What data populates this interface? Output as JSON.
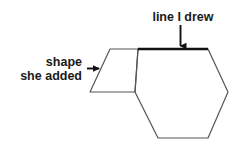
{
  "canvas": {
    "width": 240,
    "height": 143,
    "background": "#ffffff"
  },
  "colors": {
    "shape_stroke": "#555555",
    "thick_line": "#111111",
    "text": "#1a1a1a",
    "arrow": "#111111"
  },
  "annotations": {
    "top_label": {
      "text": "line I drew",
      "arrow": "down-arrow"
    },
    "left_label": {
      "line1": "shape",
      "line2": "she added",
      "arrow": "right-arrow"
    }
  },
  "figure": {
    "parallelogram": {
      "name": "parallelogram-shape-she-added",
      "points": "110,49 138,49 135,92 90,92"
    },
    "hexagon": {
      "name": "hexagon-shape",
      "points": "138,49 208,49 228,92 208,138 158,138 135,92"
    },
    "highlighted_edge": {
      "name": "thick-top-edge-line-i-drew",
      "x1": 138,
      "y1": 49,
      "x2": 208,
      "y2": 49
    }
  }
}
